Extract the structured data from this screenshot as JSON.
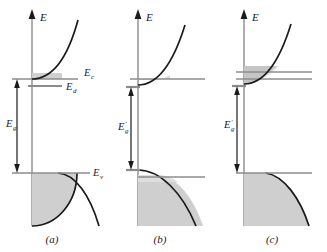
{
  "figure": {
    "title": "",
    "background_color": "#ffffff",
    "axis_label": "E",
    "curve_color": "#1a1a1a",
    "level_line_color": "#8c8c8c",
    "fill_color": "#cfcfcf",
    "arrow_color": "#1a1a1a"
  },
  "panels": [
    {
      "id": "a",
      "caption": "(a)",
      "axis_label": "E",
      "gap_label": "E",
      "gap_sub": "g",
      "gap_prime": "",
      "levels": [
        {
          "name": "conduction-band-edge",
          "label": "E",
          "sub": "c",
          "show_label": true
        },
        {
          "name": "donor-level",
          "label": "E",
          "sub": "d",
          "show_label": true
        },
        {
          "name": "valence-band-edge",
          "label": "E",
          "sub": "v",
          "show_label": true
        }
      ],
      "has_donor_level": true,
      "conduction_fill": "small",
      "valence_notch": false
    },
    {
      "id": "b",
      "caption": "(b)",
      "axis_label": "E",
      "gap_label": "E",
      "gap_sub": "g",
      "gap_prime": "′",
      "levels": [
        {
          "name": "conduction-band-edge",
          "label": "E",
          "sub": "c",
          "show_label": false
        },
        {
          "name": "valence-band-edge",
          "label": "E",
          "sub": "v",
          "show_label": false
        }
      ],
      "has_donor_level": false,
      "conduction_fill": "small",
      "valence_notch": true
    },
    {
      "id": "c",
      "caption": "(c)",
      "axis_label": "E",
      "gap_label": "E",
      "gap_sub": "g",
      "gap_prime": "′",
      "levels": [
        {
          "name": "conduction-band-edge",
          "label": "E",
          "sub": "c",
          "show_label": false
        },
        {
          "name": "valence-band-edge",
          "label": "E",
          "sub": "v",
          "show_label": false
        }
      ],
      "has_donor_level": false,
      "conduction_fill": "large",
      "valence_notch": false
    }
  ],
  "captions": {
    "a": "(a)",
    "b": "(b)",
    "c": "(c)"
  },
  "labels": {
    "E": "E",
    "Ec_main": "E",
    "Ec_sub": "c",
    "Ed_main": "E",
    "Ed_sub": "d",
    "Ev_main": "E",
    "Ev_sub": "v",
    "Eg_main": "E",
    "Eg_sub": "g",
    "prime": "′"
  }
}
